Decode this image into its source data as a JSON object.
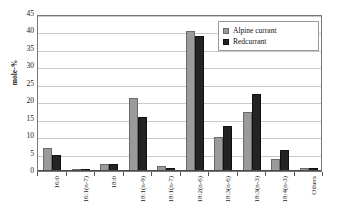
{
  "chart_data": {
    "type": "bar",
    "title": "",
    "xlabel": "",
    "ylabel": "mole-%",
    "ylim": [
      0,
      45
    ],
    "ytick_step": 5,
    "yticks": [
      0,
      5,
      10,
      15,
      20,
      25,
      30,
      35,
      40,
      45
    ],
    "grid": true,
    "legend_position": "top-right",
    "categories": [
      "16:0",
      "16:1(n-7)",
      "18:0",
      "18:1(n-9)",
      "18:1(n-7)",
      "18:2(n-6)",
      "18:3(n-6)",
      "18:3(n-3)",
      "18:4(n-3)",
      "Others"
    ],
    "series": [
      {
        "name": "Alpine currant",
        "color": "#9a9a9a",
        "values": [
          6.5,
          0.3,
          1.9,
          20.8,
          1.3,
          40.2,
          9.8,
          17.0,
          3.4,
          1.0
        ]
      },
      {
        "name": "Redcurrant",
        "color": "#232323",
        "values": [
          4.7,
          0.3,
          2.1,
          15.4,
          0.8,
          38.6,
          12.9,
          22.1,
          6.0,
          0.9
        ]
      }
    ]
  },
  "legend": {
    "items": [
      {
        "label": "Alpine currant"
      },
      {
        "label": "Redcurrant"
      }
    ]
  }
}
